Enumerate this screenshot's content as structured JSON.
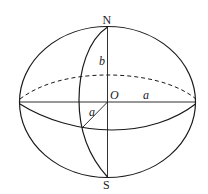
{
  "diagram": {
    "type": "ellipsoid-of-revolution",
    "labels": {
      "north_pole": "N",
      "south_pole": "S",
      "center": "O",
      "semi_minor_axis": "b",
      "semi_major_axis": "a",
      "semi_major_axis_front": "a"
    },
    "colors": {
      "stroke": "#1a1a1a",
      "background": "#ffffff"
    }
  }
}
